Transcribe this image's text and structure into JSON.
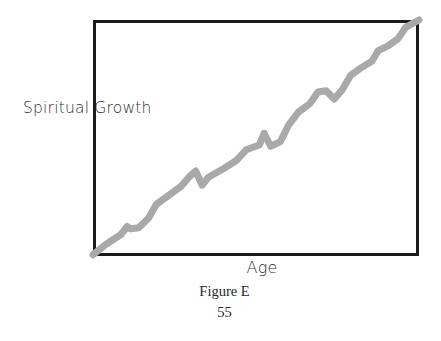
{
  "figure": {
    "caption": "Figure E",
    "page_number": "55",
    "frame_color": "#1b1b1b",
    "line_color": "#a9a9a9",
    "background_color": "#ffffff"
  },
  "chart_data": {
    "type": "line",
    "title": "",
    "subtitle": "",
    "xlabel": "Age",
    "ylabel": "Spiritual Growth",
    "grid": false,
    "legend": null,
    "axis_ticks": {
      "x": [],
      "y": []
    },
    "xlim": [
      0,
      100
    ],
    "ylim": [
      0,
      100
    ],
    "annotations": [],
    "series": [
      {
        "name": "Spiritual Growth over Age",
        "color": "#a9a9a9",
        "line_width": 7,
        "description": "Steadily rising staircase-like line from the bottom-left corner to the top-right corner, with small plateaus, short dips and steeper risers rather than a smooth slope.",
        "points": [
          {
            "x": 0.0,
            "y": 0.5
          },
          {
            "x": 4.0,
            "y": 5.0
          },
          {
            "x": 8.5,
            "y": 9.0
          },
          {
            "x": 10.5,
            "y": 12.5
          },
          {
            "x": 11.5,
            "y": 11.5
          },
          {
            "x": 14.0,
            "y": 12.0
          },
          {
            "x": 17.0,
            "y": 16.0
          },
          {
            "x": 19.5,
            "y": 22.0
          },
          {
            "x": 23.0,
            "y": 25.5
          },
          {
            "x": 27.0,
            "y": 29.5
          },
          {
            "x": 29.5,
            "y": 33.5
          },
          {
            "x": 31.5,
            "y": 36.0
          },
          {
            "x": 33.5,
            "y": 30.0
          },
          {
            "x": 35.5,
            "y": 33.5
          },
          {
            "x": 40.0,
            "y": 37.0
          },
          {
            "x": 44.0,
            "y": 40.5
          },
          {
            "x": 47.0,
            "y": 45.0
          },
          {
            "x": 51.0,
            "y": 47.0
          },
          {
            "x": 52.5,
            "y": 52.0
          },
          {
            "x": 54.5,
            "y": 46.5
          },
          {
            "x": 57.5,
            "y": 48.5
          },
          {
            "x": 60.0,
            "y": 55.5
          },
          {
            "x": 63.0,
            "y": 61.0
          },
          {
            "x": 66.5,
            "y": 64.5
          },
          {
            "x": 69.0,
            "y": 69.5
          },
          {
            "x": 71.5,
            "y": 70.0
          },
          {
            "x": 74.0,
            "y": 66.5
          },
          {
            "x": 76.5,
            "y": 70.5
          },
          {
            "x": 79.0,
            "y": 76.5
          },
          {
            "x": 82.0,
            "y": 79.5
          },
          {
            "x": 85.5,
            "y": 82.5
          },
          {
            "x": 87.5,
            "y": 87.0
          },
          {
            "x": 90.5,
            "y": 89.0
          },
          {
            "x": 93.5,
            "y": 92.0
          },
          {
            "x": 96.0,
            "y": 97.0
          },
          {
            "x": 100.0,
            "y": 100.0
          }
        ]
      }
    ]
  }
}
